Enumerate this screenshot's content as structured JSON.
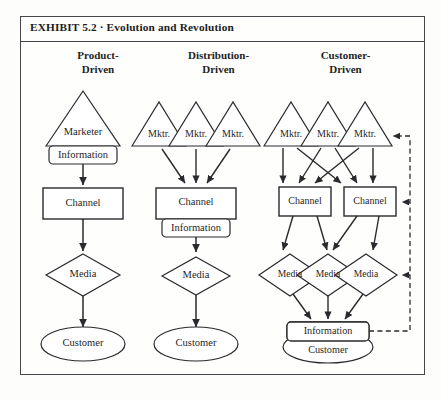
{
  "exhibit": {
    "title": "EXHIBIT 5.2  ·  Evolution and Revolution"
  },
  "columns": [
    {
      "id": "product-driven",
      "header_line1": "Product-",
      "header_line2": "Driven"
    },
    {
      "id": "distribution-driven",
      "header_line1": "Distribution-",
      "header_line2": "Driven"
    },
    {
      "id": "customer-driven",
      "header_line1": "Customer-",
      "header_line2": "Driven"
    }
  ],
  "labels": {
    "marketer": "Marketer",
    "mktr": "Mktr.",
    "information": "Information",
    "channel": "Channel",
    "media": "Media",
    "customer": "Customer"
  },
  "diagram": {
    "col1": {
      "triangle": "Marketer",
      "information": "Information",
      "channel": "Channel",
      "media": "Media",
      "customer": "Customer"
    },
    "col2": {
      "triangles": [
        "Mktr.",
        "Mktr.",
        "Mktr."
      ],
      "channel": "Channel",
      "information": "Information",
      "media": "Media",
      "customer": "Customer"
    },
    "col3": {
      "triangles": [
        "Mktr.",
        "Mktr.",
        "Mktr."
      ],
      "channels": [
        "Channel",
        "Channel"
      ],
      "medias": [
        "Media",
        "Media",
        "Media"
      ],
      "information": "Information",
      "customer": "Customer"
    }
  },
  "colors": {
    "frame": "#46464a",
    "stroke": "#2a2a2e",
    "text": "#1f1f1f",
    "background": "#fefefd",
    "dashed": "#2a2a2e"
  }
}
